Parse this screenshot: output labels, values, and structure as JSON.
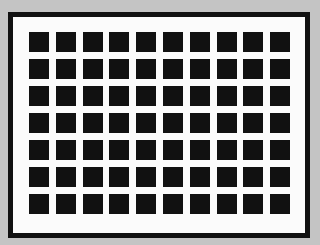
{
  "figure": {
    "type": "grid-illusion",
    "rows": 7,
    "columns": 10,
    "colors": {
      "background": "#c4c4c4",
      "frame_border": "#111111",
      "frame_fill": "#fbfbfb",
      "square": "#111111"
    }
  }
}
